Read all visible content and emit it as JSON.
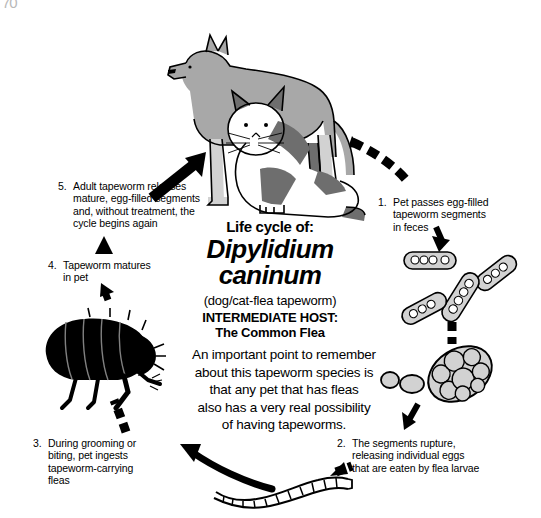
{
  "artifact": {
    "text": "70"
  },
  "title": {
    "line1": "Life cycle of:",
    "genus": "Dipylidium",
    "species": "caninum",
    "common_name": "(dog/cat-flea tapeworm)",
    "host_label": "INTERMEDIATE HOST:",
    "host_value": "The Common Flea"
  },
  "note": {
    "line1": "An important point to remember",
    "line2": "about this tapeworm species is",
    "line3": "that any pet that has fleas",
    "line4": "also has a very real possibility",
    "line5": "of having tapeworms."
  },
  "steps": [
    {
      "number": "1.",
      "lines": [
        "Pet passes egg-filled",
        "tapeworm segments",
        "in feces"
      ]
    },
    {
      "number": "2.",
      "lines": [
        "The segments rupture,",
        "releasing individual eggs",
        "that are eaten by flea larvae"
      ]
    },
    {
      "number": "3.",
      "lines": [
        "During grooming or",
        "biting, pet ingests",
        "tapeworm-carrying",
        "fleas"
      ]
    },
    {
      "number": "4.",
      "lines": [
        "Tapeworm matures",
        "in pet"
      ]
    },
    {
      "number": "5.",
      "lines": [
        "Adult tapeworm releases",
        "mature, egg-filled segments",
        "and, without treatment, the",
        "cycle begins again"
      ]
    }
  ],
  "illustrations": {
    "pets": "dog-and-cat-illustration",
    "flea": "flea-illustration",
    "segments": "proglottid-segments-illustration",
    "egg_cluster": "ruptured-segment-eggs-illustration",
    "tapeworm": "adult-tapeworm-illustration"
  },
  "colors": {
    "ink": "#000000",
    "background": "#ffffff",
    "dog_body": "#a8a8a8",
    "dog_shadow": "#6e6e6e",
    "cat_patch": "#6e6e6e",
    "egg_fill": "#d2d2d2"
  }
}
